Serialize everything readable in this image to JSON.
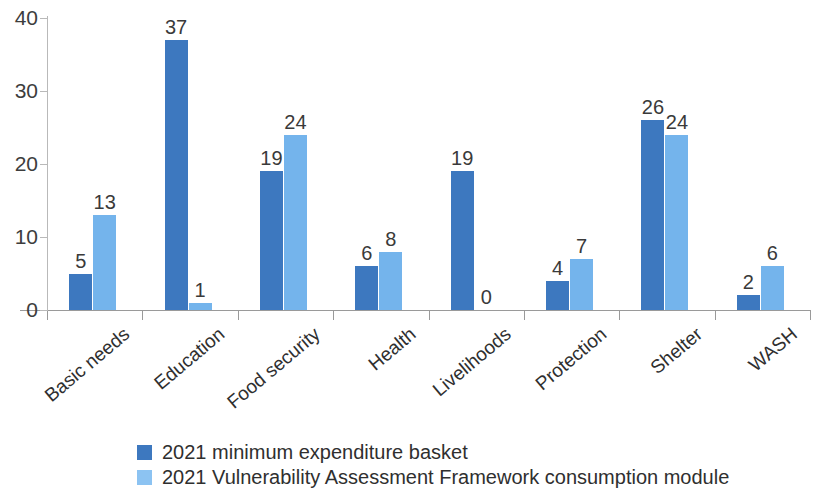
{
  "chart_data": {
    "type": "bar",
    "title": "",
    "subtitle": "",
    "xlabel": "",
    "ylabel": "",
    "ylim": [
      0,
      40
    ],
    "yticks": [
      0,
      10,
      20,
      30,
      40
    ],
    "grid": false,
    "legend_position": "bottom",
    "categories": [
      "Basic needs",
      "Education",
      "Food security",
      "Health",
      "Livelihoods",
      "Protection",
      "Shelter",
      "WASH"
    ],
    "series": [
      {
        "name": "2021 minimum expenditure basket",
        "color": "#3d78bf",
        "values": [
          5,
          37,
          19,
          6,
          19,
          4,
          26,
          2
        ]
      },
      {
        "name": "2021 Vulnerability Assessment Framework consumption module",
        "color": "#74b4ec",
        "values": [
          13,
          1,
          24,
          8,
          0,
          7,
          24,
          6
        ]
      }
    ]
  },
  "axis": {
    "y_tick_labels": [
      "0",
      "10",
      "20",
      "30",
      "40"
    ]
  },
  "legend": {
    "items": [
      {
        "label": "2021 minimum expenditure basket",
        "swatch": "series-0-swatch"
      },
      {
        "label": "2021 Vulnerability Assessment Framework consumption module",
        "swatch": "series-1-swatch"
      }
    ]
  },
  "colors": {
    "series_0": "#3d78bf",
    "series_1": "#74b4ec",
    "axis": "#9a9a9a",
    "text": "#3a3a3a",
    "background": "#ffffff"
  }
}
